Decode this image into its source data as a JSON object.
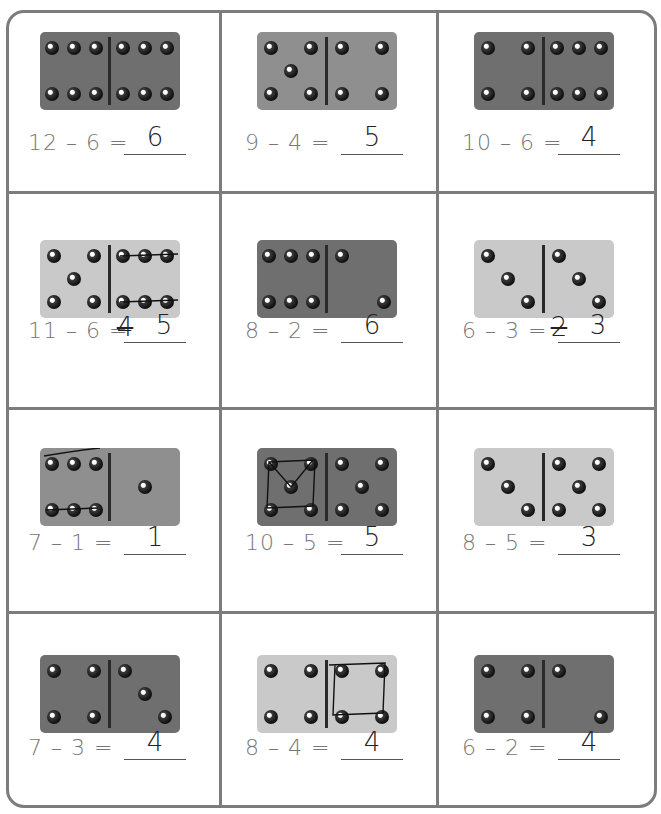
{
  "worksheet": {
    "colors": {
      "border": "#7c7c7c",
      "domino_dark": "#6f6f6f",
      "domino_mid": "#8f8f8f",
      "domino_light": "#c9c9c9",
      "pip": "#1a1a1a"
    },
    "problems": [
      {
        "equation": "12 – 6 =",
        "answer": "6",
        "left_pips": 6,
        "right_pips": 6,
        "shade": "dark",
        "marks": ""
      },
      {
        "equation": "9 – 4 =",
        "answer": "5",
        "left_pips": 5,
        "right_pips": 4,
        "shade": "mid",
        "marks": ""
      },
      {
        "equation": "10 – 6 =",
        "answer": "4",
        "left_pips": 4,
        "right_pips": 6,
        "shade": "dark",
        "marks": ""
      },
      {
        "equation": "11 – 6 =",
        "answer": "5",
        "crossed_out": "4",
        "left_pips": 5,
        "right_pips": 6,
        "shade": "light",
        "marks": "right pips crossed out"
      },
      {
        "equation": "8 – 2 =",
        "answer": "6",
        "left_pips": 6,
        "right_pips": 2,
        "shade": "dark",
        "marks": ""
      },
      {
        "equation": "6 – 3 =",
        "answer": "3",
        "crossed_out": "2",
        "left_pips": 3,
        "right_pips": 3,
        "shade": "light",
        "marks": ""
      },
      {
        "equation": "7 – 1 =",
        "answer": "1",
        "left_pips": 6,
        "right_pips": 1,
        "shade": "mid",
        "marks": "left pips crossed out"
      },
      {
        "equation": "10 – 5 =",
        "answer": "5",
        "left_pips": 5,
        "right_pips": 5,
        "shade": "dark",
        "marks": "left pips circled"
      },
      {
        "equation": "8 – 5 =",
        "answer": "3",
        "left_pips": 3,
        "right_pips": 5,
        "shade": "light",
        "marks": ""
      },
      {
        "equation": "7 – 3 =",
        "answer": "4",
        "left_pips": 4,
        "right_pips": 3,
        "shade": "dark",
        "marks": ""
      },
      {
        "equation": "8 – 4 =",
        "answer": "4",
        "left_pips": 4,
        "right_pips": 4,
        "shade": "light",
        "marks": "right pips circled"
      },
      {
        "equation": "6 – 2 =",
        "answer": "4",
        "left_pips": 4,
        "right_pips": 2,
        "shade": "dark",
        "marks": ""
      }
    ]
  }
}
